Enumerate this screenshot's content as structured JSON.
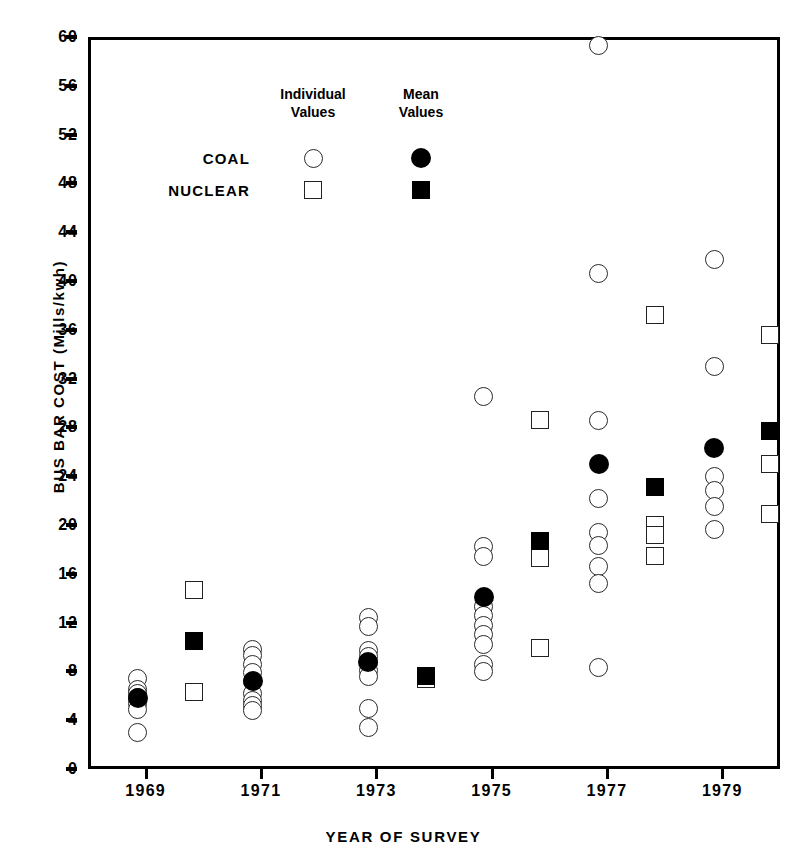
{
  "chart_data": {
    "type": "scatter",
    "title": "",
    "xlabel": "YEAR OF SURVEY",
    "ylabel": "BUS BAR COST  (Mills/kwh)",
    "ylim": [
      0,
      60
    ],
    "yticks": [
      0,
      4,
      8,
      12,
      16,
      20,
      24,
      28,
      32,
      36,
      40,
      44,
      48,
      52,
      56,
      60
    ],
    "categories": [
      "1969",
      "1971",
      "1973",
      "1975",
      "1977",
      "1979"
    ],
    "grid": false,
    "legend_position": "inside-top-left",
    "legend": {
      "columns": [
        "Individual\nValues",
        "Mean\nValues"
      ],
      "column_1_line_1": "Individual",
      "column_1_line_2": "Values",
      "column_2_line_1": "Mean",
      "column_2_line_2": "Values",
      "rows": [
        "COAL",
        "NUCLEAR"
      ],
      "coal_marker": "open-circle",
      "coal_mean_marker": "filled-circle",
      "nuclear_marker": "open-square",
      "nuclear_mean_marker": "filled-square"
    },
    "series": [
      {
        "name": "COAL",
        "marker": "open-circle",
        "type": "individual",
        "points": [
          {
            "year": "1969",
            "value": 7.4
          },
          {
            "year": "1969",
            "value": 6.5
          },
          {
            "year": "1969",
            "value": 6.2
          },
          {
            "year": "1969",
            "value": 5.9
          },
          {
            "year": "1969",
            "value": 5.4
          },
          {
            "year": "1969",
            "value": 4.9
          },
          {
            "year": "1969",
            "value": 3.0
          },
          {
            "year": "1971",
            "value": 9.8
          },
          {
            "year": "1971",
            "value": 9.3
          },
          {
            "year": "1971",
            "value": 8.6
          },
          {
            "year": "1971",
            "value": 7.9
          },
          {
            "year": "1971",
            "value": 7.2
          },
          {
            "year": "1971",
            "value": 6.2
          },
          {
            "year": "1971",
            "value": 5.6
          },
          {
            "year": "1971",
            "value": 5.2
          },
          {
            "year": "1971",
            "value": 4.8
          },
          {
            "year": "1973",
            "value": 12.4
          },
          {
            "year": "1973",
            "value": 11.7
          },
          {
            "year": "1973",
            "value": 9.7
          },
          {
            "year": "1973",
            "value": 9.2
          },
          {
            "year": "1973",
            "value": 8.7
          },
          {
            "year": "1973",
            "value": 8.1
          },
          {
            "year": "1973",
            "value": 7.6
          },
          {
            "year": "1973",
            "value": 5.0
          },
          {
            "year": "1973",
            "value": 3.4
          },
          {
            "year": "1975",
            "value": 30.5
          },
          {
            "year": "1975",
            "value": 18.2
          },
          {
            "year": "1975",
            "value": 17.4
          },
          {
            "year": "1975",
            "value": 13.3
          },
          {
            "year": "1975",
            "value": 12.6
          },
          {
            "year": "1975",
            "value": 11.8
          },
          {
            "year": "1975",
            "value": 11.0
          },
          {
            "year": "1975",
            "value": 10.2
          },
          {
            "year": "1975",
            "value": 8.6
          },
          {
            "year": "1975",
            "value": 8.0
          },
          {
            "year": "1977",
            "value": 59.3
          },
          {
            "year": "1977",
            "value": 40.6
          },
          {
            "year": "1977",
            "value": 28.6
          },
          {
            "year": "1977",
            "value": 22.2
          },
          {
            "year": "1977",
            "value": 19.4
          },
          {
            "year": "1977",
            "value": 18.3
          },
          {
            "year": "1977",
            "value": 16.6
          },
          {
            "year": "1977",
            "value": 15.2
          },
          {
            "year": "1977",
            "value": 8.3
          },
          {
            "year": "1979",
            "value": 41.8
          },
          {
            "year": "1979",
            "value": 33.0
          },
          {
            "year": "1979",
            "value": 24.0
          },
          {
            "year": "1979",
            "value": 22.8
          },
          {
            "year": "1979",
            "value": 21.5
          },
          {
            "year": "1979",
            "value": 19.6
          }
        ]
      },
      {
        "name": "COAL",
        "marker": "filled-circle",
        "type": "mean",
        "points": [
          {
            "year": "1969",
            "value": 5.8
          },
          {
            "year": "1971",
            "value": 7.2
          },
          {
            "year": "1973",
            "value": 8.8
          },
          {
            "year": "1975",
            "value": 14.1
          },
          {
            "year": "1977",
            "value": 25.0
          },
          {
            "year": "1979",
            "value": 26.3
          }
        ]
      },
      {
        "name": "NUCLEAR",
        "marker": "open-square",
        "type": "individual",
        "points": [
          {
            "year": "1969",
            "value": 14.7
          },
          {
            "year": "1969",
            "value": 6.3
          },
          {
            "year": "1973",
            "value": 7.4
          },
          {
            "year": "1975",
            "value": 28.6
          },
          {
            "year": "1975",
            "value": 17.3
          },
          {
            "year": "1975",
            "value": 9.9
          },
          {
            "year": "1977",
            "value": 37.2
          },
          {
            "year": "1977",
            "value": 20.0
          },
          {
            "year": "1977",
            "value": 19.2
          },
          {
            "year": "1977",
            "value": 17.5
          },
          {
            "year": "1979",
            "value": 35.6
          },
          {
            "year": "1979",
            "value": 25.0
          },
          {
            "year": "1979",
            "value": 20.9
          }
        ]
      },
      {
        "name": "NUCLEAR",
        "marker": "filled-square",
        "type": "mean",
        "points": [
          {
            "year": "1969",
            "value": 10.5
          },
          {
            "year": "1973",
            "value": 7.6
          },
          {
            "year": "1975",
            "value": 18.7
          },
          {
            "year": "1977",
            "value": 23.1
          },
          {
            "year": "1979",
            "value": 27.7
          }
        ]
      }
    ]
  }
}
